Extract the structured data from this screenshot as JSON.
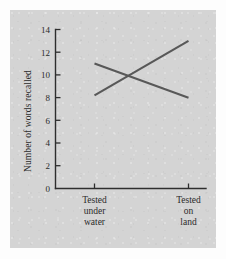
{
  "chart_data": {
    "type": "line",
    "title": "",
    "subtitle": "",
    "xlabel": "",
    "ylabel": "Number of words recalled",
    "categories": [
      "Tested under water",
      "Tested on land"
    ],
    "category_lines": [
      [
        "Tested",
        "under",
        "water"
      ],
      [
        "Tested",
        "on",
        "land"
      ]
    ],
    "ylim": [
      0,
      14
    ],
    "yticks": [
      0,
      2,
      4,
      6,
      8,
      10,
      12,
      14
    ],
    "ytick_labels": [
      "0",
      "2",
      "4",
      "6",
      "8",
      "10",
      "12",
      "14"
    ],
    "grid": false,
    "legend": "none",
    "series": [
      {
        "name": "Learned on land",
        "values": [
          8.2,
          13.0
        ]
      },
      {
        "name": "Learned under water",
        "values": [
          11.0,
          8.0
        ]
      }
    ],
    "line_color": "#585858",
    "axis_color": "#2e2e2e",
    "panel_color": "#d4d4d4",
    "background_color": "#fdfdfd"
  }
}
